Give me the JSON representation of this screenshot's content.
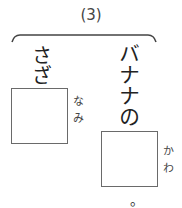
{
  "question": {
    "number": "(3)"
  },
  "items": [
    {
      "word": "さざ",
      "answer_furigana": "なみ"
    },
    {
      "word": "バナナの",
      "answer_furigana": "かわ",
      "ending": "。"
    }
  ]
}
